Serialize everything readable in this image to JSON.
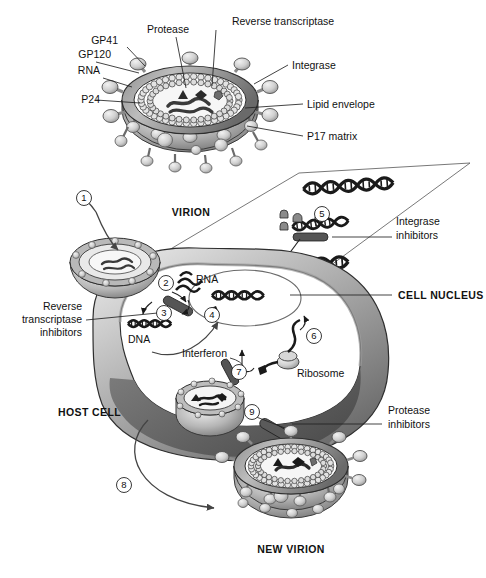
{
  "figure": {
    "style": "grayscale scientific illustration"
  },
  "virion_labels": {
    "gp120": "GP120",
    "gp41": "GP41",
    "rna": "RNA",
    "p24": "P24",
    "protease": "Protease",
    "reverse_transcriptase": "Reverse transcriptase",
    "integrase": "Integrase",
    "lipid_envelope": "Lipid envelope",
    "p17_matrix": "P17 matrix"
  },
  "captions": {
    "virion": "VIRION",
    "host_cell": "HOST CELL",
    "cell_nucleus": "CELL NUCLEUS",
    "new_virion": "NEW VIRION"
  },
  "inhibitors": {
    "reverse_transcriptase": "Reverse\ntranscriptase\ninhibitors",
    "reverse_transcriptase_l1": "Reverse",
    "reverse_transcriptase_l2": "transcriptase",
    "reverse_transcriptase_l3": "inhibitors",
    "integrase_l1": "Integrase",
    "integrase_l2": "inhibitors",
    "protease_l1": "Protease",
    "protease_l2": "inhibitors"
  },
  "molecules": {
    "dna": "DNA",
    "rna": "RNA",
    "interferon": "Interferon",
    "ribosome": "Ribosome"
  },
  "steps": [
    {
      "n": "1",
      "x": 84,
      "y": 198,
      "desc": "virion attaches and enters host cell"
    },
    {
      "n": "2",
      "x": 166,
      "y": 283,
      "desc": "uncoating releases viral RNA"
    },
    {
      "n": "3",
      "x": 164,
      "y": 313,
      "desc": "reverse transcription RNA to DNA"
    },
    {
      "n": "4",
      "x": 212,
      "y": 315,
      "desc": "viral DNA enters nucleus"
    },
    {
      "n": "5",
      "x": 322,
      "y": 214,
      "desc": "integration into host DNA"
    },
    {
      "n": "6",
      "x": 314,
      "y": 336,
      "desc": "transcription and translation"
    },
    {
      "n": "7",
      "x": 239,
      "y": 372,
      "desc": "interferon blocks protein synthesis"
    },
    {
      "n": "8",
      "x": 124,
      "y": 485,
      "desc": "new virion released"
    },
    {
      "n": "9",
      "x": 252,
      "y": 412,
      "desc": "protease cleaves polyprotein during budding"
    }
  ],
  "colors": {
    "envelope_dark": "#6f6f6f",
    "envelope_mid": "#9a9a9a",
    "envelope_light": "#cfcfcf",
    "cell_dark": "#5e5e5e",
    "cell_mid": "#8d8d8d",
    "outline": "#222222",
    "white": "#ffffff",
    "dna_dark": "#1a1a1a"
  }
}
